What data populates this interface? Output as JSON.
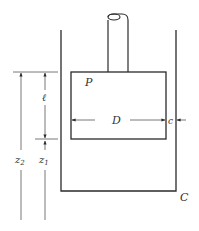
{
  "diagram": {
    "type": "piston-in-cylinder",
    "labels": {
      "piston": "P",
      "cylinder": "C",
      "piston_diameter": "D",
      "clearance": "c",
      "piston_length": "ℓ",
      "z2": "z",
      "z2_sub": "2",
      "z1": "z",
      "z1_sub": "1"
    },
    "colors": {
      "stroke": "#2a2a2a",
      "background": "#ffffff"
    }
  }
}
